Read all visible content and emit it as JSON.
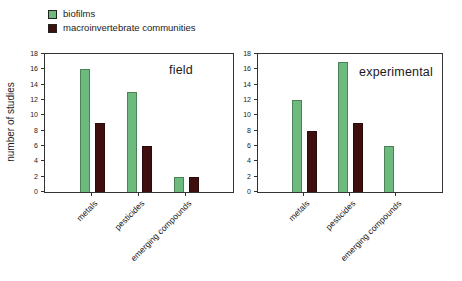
{
  "figure": {
    "legend": [
      {
        "label": "biofilms",
        "color": "#6cba7d"
      },
      {
        "label": "macroinvertebrate communities",
        "color": "#3f0e0f"
      }
    ],
    "legend_position": "top-left",
    "axis_color": "#333333"
  },
  "chart_data": [
    {
      "type": "bar",
      "title": "field",
      "categories": [
        "metals",
        "pesticides",
        "emerging compounds"
      ],
      "series": [
        {
          "name": "biofilms",
          "color": "#6cba7d",
          "values": [
            16,
            13,
            2
          ]
        },
        {
          "name": "macroinvertebrate communities",
          "color": "#3f0e0f",
          "values": [
            9,
            6,
            2
          ]
        }
      ],
      "xlabel": "",
      "ylabel": "number of studies",
      "ylim": [
        0,
        18
      ],
      "yticks": [
        0,
        2,
        4,
        6,
        8,
        10,
        12,
        14,
        16,
        18
      ],
      "grid": false
    },
    {
      "type": "bar",
      "title": "experimental",
      "categories": [
        "metals",
        "pesticides",
        "emerging compounds"
      ],
      "series": [
        {
          "name": "biofilms",
          "color": "#6cba7d",
          "values": [
            12,
            17,
            6
          ]
        },
        {
          "name": "macroinvertebrate communities",
          "color": "#3f0e0f",
          "values": [
            8,
            9,
            0
          ]
        }
      ],
      "xlabel": "",
      "ylabel": "",
      "ylim": [
        0,
        18
      ],
      "yticks": [
        0,
        2,
        4,
        6,
        8,
        10,
        12,
        14,
        16,
        18
      ],
      "grid": false
    }
  ]
}
